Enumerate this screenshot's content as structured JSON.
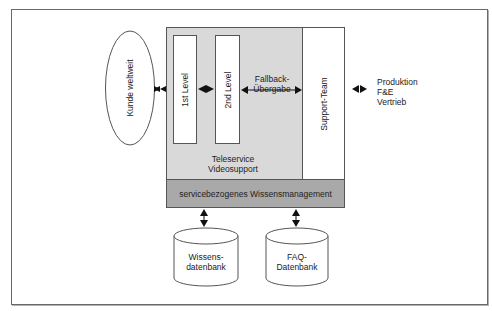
{
  "diagram": {
    "customer": {
      "label": "Kunde weltweit"
    },
    "levels": [
      {
        "label": "1st Level"
      },
      {
        "label": "2nd Level"
      }
    ],
    "fallback": {
      "line1": "Fallback-",
      "line2": "Übergabe"
    },
    "support_team": {
      "label": "Support-Team"
    },
    "teleservice": {
      "line1": "Teleservice",
      "line2": "Videosupport"
    },
    "knowledge_management": {
      "label": "servicebezogenes Wissensmanagement"
    },
    "external": {
      "lines": [
        "Produktion",
        "F&E",
        "Vertrieb"
      ]
    },
    "databases": [
      {
        "line1": "Wissens-",
        "line2": "datenbank"
      },
      {
        "line1": "FAQ-",
        "line2": "Datenbank"
      }
    ],
    "colors": {
      "outer_gray": "#d9d9d9",
      "bar_gray": "#a9a9a9",
      "border": "#555555",
      "arrow": "#111111"
    }
  }
}
